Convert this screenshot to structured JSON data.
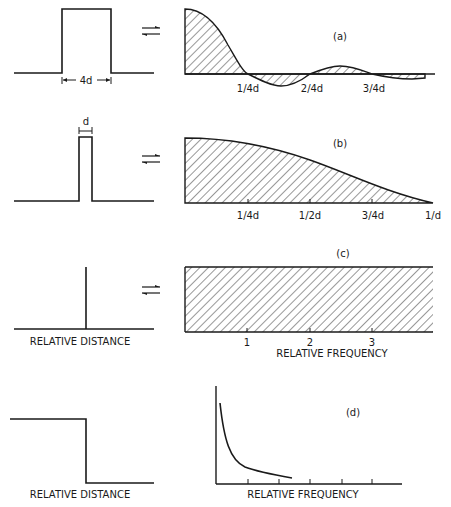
{
  "panels": {
    "a": {
      "label": "(a)",
      "width_label": "4d",
      "ticks": [
        "1/4d",
        "2/4d",
        "3/4d"
      ]
    },
    "b": {
      "label": "(b)",
      "width_label": "d",
      "ticks": [
        "1/4d",
        "1/2d",
        "3/4d",
        "1/d"
      ]
    },
    "c": {
      "label": "(c)",
      "ticks": [
        "1",
        "2",
        "3"
      ],
      "xlabel_left": "RELATIVE DISTANCE",
      "xlabel_right": "RELATIVE FREQUENCY"
    },
    "d": {
      "label": "(d)",
      "xlabel_left": "RELATIVE DISTANCE",
      "xlabel_right": "RELATIVE FREQUENCY"
    }
  },
  "transform_symbol": "⇄",
  "colors": {
    "ink": "#1a1a1a",
    "background": "#ffffff"
  }
}
